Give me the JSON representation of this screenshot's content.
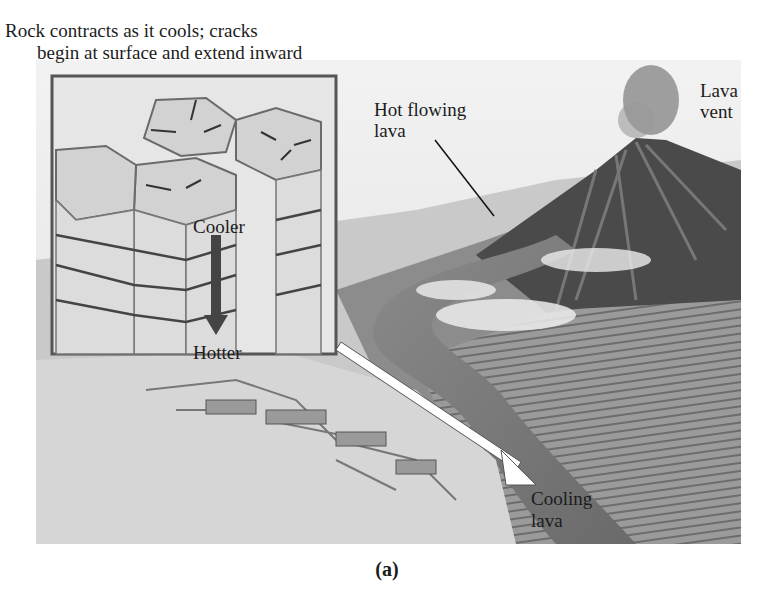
{
  "figure": {
    "caption": "(a)",
    "labels": {
      "top_note_line1": "Rock contracts as it cools; cracks",
      "top_note_line2": "begin at surface and extend inward",
      "hot_flowing_lava_line1": "Hot flowing",
      "hot_flowing_lava_line2": "lava",
      "lava_vent_line1": "Lava",
      "lava_vent_line2": "vent",
      "cooler": "Cooler",
      "hotter": "Hotter",
      "cooling_lava_line1": "Cooling",
      "cooling_lava_line2": "lava"
    },
    "colors": {
      "ground_light": "#d9d9d9",
      "ground_mid": "#a8a8a8",
      "ground_dark": "#5e5e5e",
      "volcano": "#3f3f3f",
      "inset_border": "#555555",
      "arrow_fill": "#ffffff"
    }
  }
}
